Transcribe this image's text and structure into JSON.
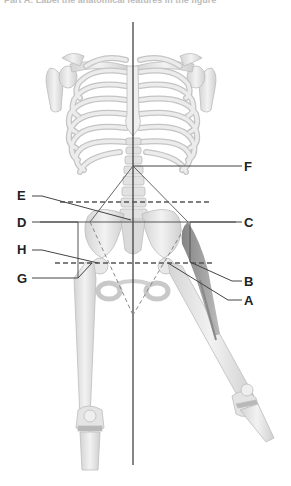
{
  "header": {
    "text": "Part A: Label the anatomical features in the figure"
  },
  "diagram": {
    "labels": {
      "left": [
        {
          "id": "E",
          "text": "E"
        },
        {
          "id": "D",
          "text": "D"
        },
        {
          "id": "H",
          "text": "H"
        },
        {
          "id": "G",
          "text": "G"
        }
      ],
      "right": [
        {
          "id": "F",
          "text": "F"
        },
        {
          "id": "C",
          "text": "C"
        },
        {
          "id": "B",
          "text": "B"
        },
        {
          "id": "A",
          "text": "A"
        }
      ]
    },
    "colors": {
      "bone": "#e6e6e6",
      "bone_shade": "#c8c8c8",
      "bone_outline": "#bdbdbd",
      "leader_line": "#444444",
      "dashed_line": "#555555",
      "midline": "#333333",
      "muscle": "#8a8a8a"
    }
  }
}
